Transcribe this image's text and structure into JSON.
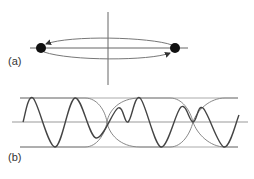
{
  "figure": {
    "panel_a": {
      "label": "(a)",
      "description": "Two point masses orbiting on elongated ellipse with arrows indicating direction; crossed axes",
      "axes": {
        "horizontal": {
          "x1": 30,
          "x2": 188,
          "y": 48
        },
        "vertical": {
          "x": 108,
          "y1": 12,
          "y2": 85
        }
      },
      "masses": [
        {
          "cx": 41,
          "cy": 48,
          "r": 5
        },
        {
          "cx": 175,
          "cy": 48,
          "r": 5
        }
      ],
      "orbit": {
        "upper_y": 39,
        "lower_y": 58
      },
      "colors": {
        "line": "#555555",
        "mass": "#111111",
        "orbit": "#777777"
      }
    },
    "panel_b": {
      "label": "(b)",
      "description": "Oscillating wave with beat envelope; three horizontal reference lines",
      "reference_lines": {
        "top_y": 98,
        "center_y": 122,
        "bottom_y": 147,
        "x1": 12,
        "x2": 248,
        "envelope_x1": 20,
        "envelope_x2": 238
      },
      "wave_path": "M23,122 C27,110 30,98 33,98 C37,98 41,110 44,122 C48,135 51,147 55,147 C59,147 62,135 65,122 C68,110 71,98 75,98 C79,98 82,110 86,122 C89,131 92,138 96,138 C100,138 103,131 107,122 C110,115 114,105 118,108 C122,112 124,118 128,122 C132,128 135,138 140,98 C142,92 145,98 148,110 C152,122 155,147 161,147 C166,147 170,135 173,122 C176,112 178,107 181,107 C185,107 189,115 193,122 C196,112 199,108 203,108 C207,108 211,122 214,132 C217,142 220,147 224,147 C228,147 233,130 239,115",
      "envelope_path": "M20,98 L85,98 C97,98 105,110 107,122 C109,110 120,98 140,98 L170,98 C182,98 190,110 193,122 C197,110 210,98 225,98 L238,98 M20,147 L85,147 C97,147 105,134 107,122 C109,134 120,147 140,147 L170,147 C182,147 190,134 193,122 C197,134 210,147 225,147 L238,147",
      "colors": {
        "wave": "#444444",
        "envelope": "#888888",
        "reference": "#999999"
      }
    }
  }
}
